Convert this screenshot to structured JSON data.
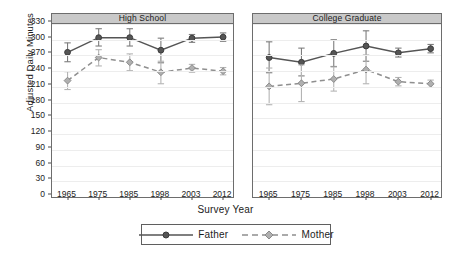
{
  "chart_data": {
    "type": "line",
    "title": "",
    "xlabel": "Survey Year",
    "ylabel": "Adjusted Daily Minutes",
    "categories": [
      "1965",
      "1975",
      "1985",
      "1998",
      "2003",
      "2012"
    ],
    "ylim": [
      0,
      330
    ],
    "yticks": [
      0,
      30,
      60,
      90,
      120,
      150,
      180,
      210,
      240,
      270,
      300,
      330
    ],
    "grid": true,
    "legend_position": "bottom-center",
    "error_bars": "95% confidence interval",
    "panels": [
      {
        "label": "High School",
        "series": [
          {
            "name": "Father",
            "style": "solid",
            "marker": "circle",
            "color": "#555555",
            "values": [
              276,
              304,
              304,
              280,
              303,
              305
            ],
            "err_low": [
              258,
              288,
              288,
              256,
              295,
              297
            ],
            "err_high": [
              294,
              321,
              321,
              303,
              310,
              313
            ]
          },
          {
            "name": "Mother",
            "style": "dashed",
            "marker": "diamond",
            "color": "#a5a5a5",
            "values": [
              222,
              266,
              257,
              238,
              246,
              240
            ],
            "err_low": [
              205,
              250,
              241,
              216,
              238,
              233
            ],
            "err_high": [
              239,
              281,
              273,
              259,
              253,
              247
            ]
          }
        ]
      },
      {
        "label": "College Graduate",
        "series": [
          {
            "name": "Father",
            "style": "solid",
            "marker": "circle",
            "color": "#555555",
            "values": [
              266,
              257,
              274,
              288,
              275,
              283
            ],
            "err_low": [
              237,
              231,
              249,
              259,
              267,
              275
            ],
            "err_high": [
              296,
              284,
              300,
              317,
              284,
              291
            ]
          },
          {
            "name": "Mother",
            "style": "dashed",
            "marker": "diamond",
            "color": "#a5a5a5",
            "values": [
              211,
              217,
              225,
              243,
              220,
              216
            ],
            "err_low": [
              176,
              182,
              202,
              216,
              212,
              209
            ],
            "err_high": [
              246,
              252,
              248,
              271,
              228,
              223
            ]
          }
        ]
      }
    ],
    "legend": [
      {
        "name": "Father",
        "style": "solid",
        "marker": "circle",
        "color": "#555555"
      },
      {
        "name": "Mother",
        "style": "dashed",
        "marker": "diamond",
        "color": "#a5a5a5"
      }
    ]
  }
}
